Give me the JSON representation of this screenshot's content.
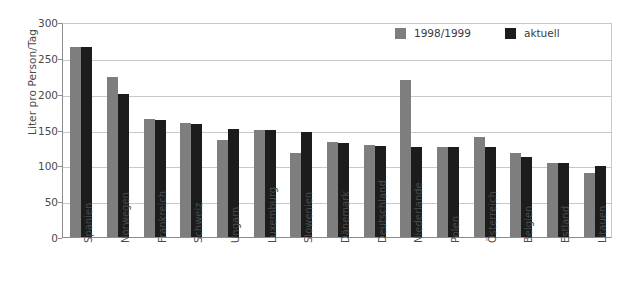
{
  "chart_data": {
    "type": "bar",
    "title": "",
    "xlabel": "",
    "ylabel": "Liter pro Person/Tag",
    "ylim": [
      0,
      300
    ],
    "yticks": [
      0,
      50,
      100,
      150,
      200,
      250,
      300
    ],
    "grid": true,
    "legend_position": "top-right",
    "categories": [
      "Spanien",
      "Norwegen",
      "Frankreich",
      "Schweiz",
      "Ungarn",
      "Luxemburg",
      "Slowenien",
      "Dänemark",
      "Deutschland",
      "Niederlande",
      "Polen",
      "Österreich",
      "Belgien",
      "Estland",
      "Litauen"
    ],
    "series": [
      {
        "name": "1998/1999",
        "color": "#7e7e7e",
        "values": [
          265,
          223,
          164,
          159,
          136,
          149,
          117,
          132,
          128,
          219,
          125,
          140,
          117,
          103,
          89
        ]
      },
      {
        "name": "aktuell",
        "color": "#1c1c1c",
        "values": [
          265,
          199,
          163,
          158,
          151,
          149,
          146,
          131,
          127,
          125,
          125,
          126,
          111,
          103,
          99
        ]
      }
    ]
  },
  "legend": {
    "items": [
      {
        "label": "1998/1999",
        "swatch": "prev"
      },
      {
        "label": "aktuell",
        "swatch": "curr"
      }
    ]
  },
  "colors": {
    "series_previous": "#7e7e7e",
    "series_current": "#1c1c1c",
    "gridline": "#c9c9c9",
    "axis": "#8c8c8c",
    "background": "#ffffff"
  }
}
